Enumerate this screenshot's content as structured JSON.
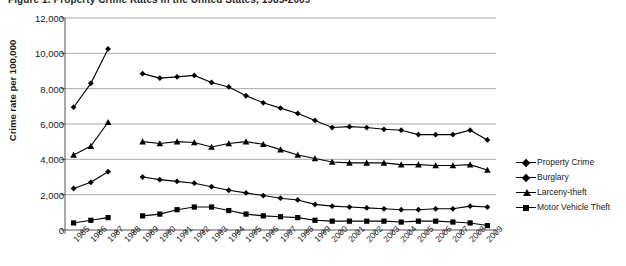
{
  "chart_data": {
    "type": "line",
    "title": "Figure 1. Property Crime Rates in the United States, 1985-2009",
    "xlabel": "",
    "ylabel": "Crime rate per 100,000",
    "ylim": [
      0,
      12000
    ],
    "ytick_values": [
      0,
      2000,
      4000,
      6000,
      8000,
      10000,
      12000
    ],
    "ytick_labels": [
      "0",
      "2,000",
      "4,000",
      "6,000",
      "8,000",
      "10,000",
      "12,000"
    ],
    "grid": true,
    "legend_position": "right",
    "categories": [
      "1985",
      "1986",
      "1987",
      "1988",
      "1989",
      "1990",
      "1991",
      "1992",
      "1993",
      "1994",
      "1995",
      "1996",
      "1997",
      "1998",
      "1999",
      "2000",
      "2001",
      "2002",
      "2003",
      "2004",
      "2005",
      "2006",
      "2007",
      "2008",
      "2009"
    ],
    "series": [
      {
        "name": "Property Crime",
        "marker": "diamond",
        "color": "#000000",
        "values": [
          6950,
          8300,
          10250,
          null,
          8850,
          8600,
          8670,
          8750,
          8350,
          8100,
          7600,
          7200,
          6900,
          6600,
          6200,
          5800,
          5850,
          5800,
          5700,
          5650,
          5400,
          5400,
          5400,
          5650,
          5100
        ]
      },
      {
        "name": "Burglary",
        "marker": "diamond",
        "color": "#000000",
        "values": [
          2350,
          2700,
          3300,
          null,
          3000,
          2850,
          2750,
          2650,
          2450,
          2250,
          2100,
          1950,
          1800,
          1700,
          1450,
          1350,
          1300,
          1250,
          1200,
          1150,
          1150,
          1200,
          1200,
          1350,
          1300
        ]
      },
      {
        "name": "Larceny-theft",
        "marker": "triangle",
        "color": "#000000",
        "values": [
          4250,
          4750,
          6100,
          null,
          5000,
          4900,
          5000,
          4950,
          4700,
          4900,
          5000,
          4850,
          4550,
          4250,
          4050,
          3850,
          3800,
          3800,
          3800,
          3700,
          3700,
          3650,
          3650,
          3700,
          3400
        ]
      },
      {
        "name": "Motor Vehicle Theft",
        "marker": "square",
        "color": "#000000",
        "values": [
          400,
          550,
          700,
          null,
          800,
          900,
          1150,
          1300,
          1300,
          1100,
          900,
          800,
          750,
          700,
          550,
          500,
          500,
          500,
          500,
          450,
          500,
          500,
          450,
          400,
          250
        ]
      }
    ],
    "legend_entries": [
      "Property Crime",
      "Burglary",
      "Larceny-theft",
      "Motor Vehicle Theft"
    ]
  }
}
